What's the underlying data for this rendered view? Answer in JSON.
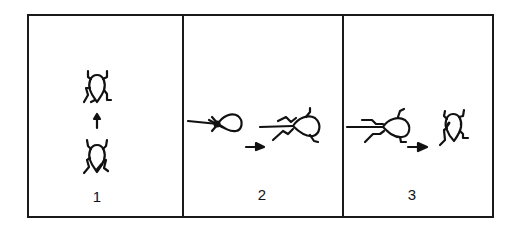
{
  "figure": {
    "panels": [
      {
        "label": "1",
        "description": "Beetle seen from above moves forward (arrow up) from lower position to upper position"
      },
      {
        "label": "2",
        "description": "Beetle pulled by line from left; arrow right; beetle with legs spread, line through body"
      },
      {
        "label": "3",
        "description": "Beetle on line; arrow right; beetle released, upright"
      }
    ],
    "colors": {
      "ink": "#111111",
      "background": "#ffffff"
    }
  }
}
